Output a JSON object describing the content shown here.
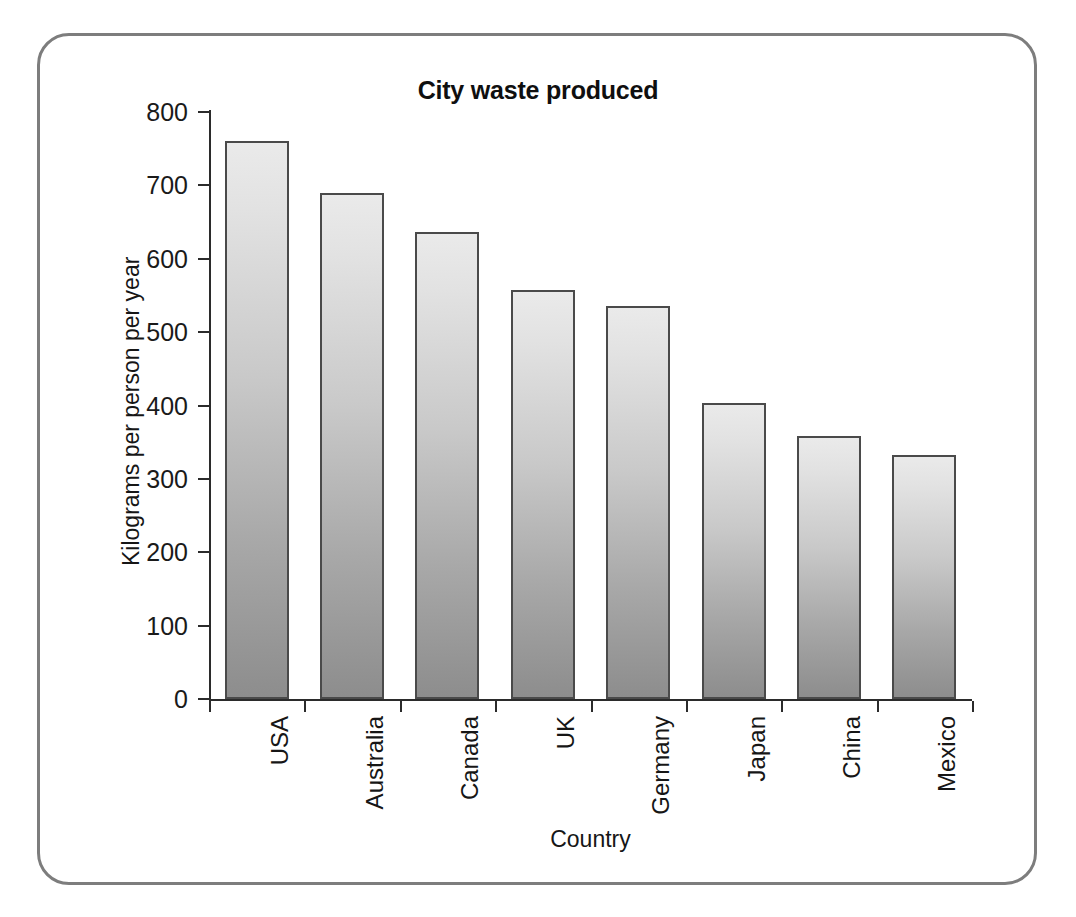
{
  "chart_data": {
    "type": "bar",
    "title": "City waste produced",
    "xlabel": "Country",
    "ylabel": "Kilograms per person per year",
    "categories": [
      "USA",
      "Australia",
      "Canada",
      "UK",
      "Germany",
      "Japan",
      "China",
      "Mexico"
    ],
    "values": [
      760,
      690,
      637,
      557,
      536,
      404,
      358,
      332
    ],
    "ylim": [
      0,
      800
    ],
    "ytick_labels": [
      "800",
      "700",
      "600",
      "500",
      "400",
      "300",
      "200",
      "100",
      "0"
    ],
    "yticks": [
      800,
      700,
      600,
      500,
      400,
      300,
      200,
      100,
      0
    ],
    "grid": false,
    "legend": "none",
    "series": [
      {
        "name": "City waste produced",
        "values": [
          760,
          690,
          637,
          557,
          536,
          404,
          358,
          332
        ]
      }
    ],
    "colors": {
      "bar_top": "#eaeaea",
      "bar_bottom": "#8d8d8d",
      "bar_border": "#4a4a4a",
      "axis": "#2b2b2b",
      "frame": "#7d7d7d",
      "text": "#161616"
    }
  }
}
